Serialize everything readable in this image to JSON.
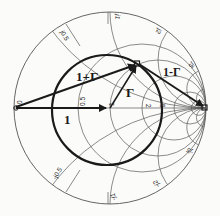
{
  "diagram": {
    "type": "smith-chart",
    "vectors": {
      "gamma_label": "Γ",
      "one_plus_gamma_label": "1+Γ",
      "one_minus_gamma_label": "1-Γ",
      "one_label": "1"
    },
    "tick_labels": {
      "resistance": [
        "0",
        "0.5",
        "1",
        "2",
        "5"
      ],
      "reactance_top": [
        "j0.5",
        "j1",
        "j2",
        "j5"
      ],
      "reactance_bottom": [
        "-j0.5",
        "-j1",
        "-j2",
        "-j5"
      ]
    },
    "colors": {
      "ink": "#1a1a1a",
      "grid": "#5a5a5a",
      "background": "#fbfbfa"
    }
  }
}
